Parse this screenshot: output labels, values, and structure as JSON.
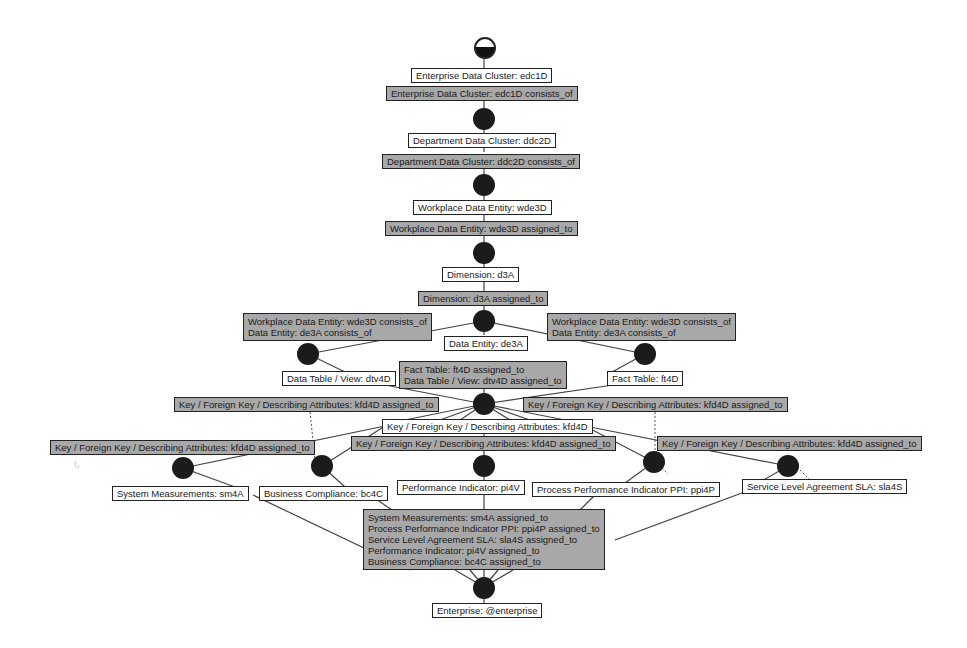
{
  "diagram": {
    "type": "process-hierarchy",
    "colors": {
      "entity_fill": "#ffffff",
      "relation_fill": "#a8a8a8",
      "node_fill": "#1b1b1b",
      "line": "#444444"
    },
    "start": {
      "label": ""
    },
    "entities": {
      "edc1D": "Enterprise Data Cluster: edc1D",
      "ddc2D": "Department Data Cluster: ddc2D",
      "wde3D": "Workplace Data Entity: wde3D",
      "d3A": "Dimension: d3A",
      "de3A": "Data Entity: de3A",
      "dtv4D": "Data Table / View: dtv4D",
      "ft4D": "Fact Table: ft4D",
      "kfd4D": "Key / Foreign Key / Describing Attributes: kfd4D",
      "sm4A": "System Measurements: sm4A",
      "bc4C": "Business Compliance: bc4C",
      "pi4V": "Performance Indicator: pi4V",
      "ppi4P": "Process Performance Indicator PPI: ppi4P",
      "sla4S": "Service Level Agreement SLA: sla4S",
      "enterprise": "Enterprise: @enterprise"
    },
    "relations": {
      "edc1D_consists": "Enterprise Data Cluster: edc1D consists_of",
      "ddc2D_consists": "Department Data Cluster: ddc2D consists_of",
      "wde3D_assigned": "Workplace Data Entity: wde3D assigned_to",
      "d3A_assigned": "Dimension: d3A assigned_to",
      "wde_de_left": "Workplace Data Entity: wde3D consists_of\nData Entity: de3A consists_of",
      "wde_de_right": "Workplace Data Entity: wde3D consists_of\nData Entity: de3A consists_of",
      "ft_dtv_assigned": "Fact Table: ft4D assigned_to\nData Table / View: dtv4D assigned_to",
      "kfd_assigned_upper_left": "Key / Foreign Key / Describing Attributes: kfd4D assigned_to",
      "kfd_assigned_upper_right": "Key / Foreign Key / Describing Attributes: kfd4D assigned_to",
      "kfd_assigned_far_left": "Key / Foreign Key / Describing Attributes: kfd4D assigned_to",
      "kfd_assigned_center": "Key / Foreign Key / Describing Attributes: kfd4D assigned_to",
      "kfd_assigned_far_right": "Key / Foreign Key / Describing Attributes: kfd4D assigned_to",
      "final_assigned": "System Measurements: sm4A assigned_to\nProcess Performance Indicator PPI: ppi4P assigned_to\nService Level Agreement SLA: sla4S assigned_to\nPerformance Indicator: pi4V assigned_to\nBusiness Compliance: bc4C assigned_to"
    },
    "artifact_text": "fₓ"
  }
}
